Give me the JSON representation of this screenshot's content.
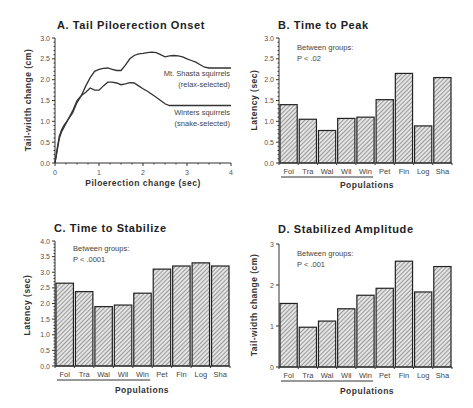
{
  "chart_data": [
    {
      "panel": "A",
      "type": "line",
      "title": "A.  Tail  Piloerection  Onset",
      "xlabel": "Piloerection  change  (sec)",
      "ylabel": "Tail-width  change  (cm)",
      "xlim": [
        0,
        4
      ],
      "ylim": [
        0,
        3.0
      ],
      "xticks": [
        "0",
        "1",
        "2",
        "3",
        "4"
      ],
      "yticks": [
        "0.0",
        "0.5",
        "1.0",
        "1.5",
        "2.0",
        "2.5",
        "3.0"
      ],
      "grid": false,
      "series": [
        {
          "name": "Mt. Shasta squirrels (relax-selected)",
          "label_lines": [
            "Mt. Shasta squirrels",
            "(relax-selected)"
          ],
          "x": [
            0,
            0.05,
            0.1,
            0.15,
            0.2,
            0.3,
            0.4,
            0.5,
            0.6,
            0.7,
            0.8,
            0.9,
            1.0,
            1.1,
            1.2,
            1.3,
            1.4,
            1.5,
            1.6,
            1.7,
            1.8,
            1.9,
            2.0,
            2.1,
            2.2,
            2.3,
            2.4,
            2.5,
            2.6,
            2.7,
            2.8,
            2.9,
            3.0,
            3.1,
            3.2,
            3.3,
            3.4,
            3.5,
            3.6,
            3.7,
            3.8,
            3.9,
            4.0
          ],
          "y": [
            0,
            0.3,
            0.6,
            0.75,
            0.85,
            1.05,
            1.2,
            1.45,
            1.62,
            1.85,
            2.05,
            2.2,
            2.25,
            2.27,
            2.28,
            2.25,
            2.22,
            2.22,
            2.35,
            2.5,
            2.58,
            2.62,
            2.63,
            2.65,
            2.66,
            2.65,
            2.6,
            2.55,
            2.57,
            2.58,
            2.57,
            2.55,
            2.5,
            2.46,
            2.42,
            2.36,
            2.3,
            2.28,
            2.28,
            2.28,
            2.28,
            2.28,
            2.28
          ]
        },
        {
          "name": "Winters squirrels (snake-selected)",
          "label_lines": [
            "Winters  squirrels",
            "(snake-selected)"
          ],
          "x": [
            0,
            0.05,
            0.1,
            0.15,
            0.2,
            0.3,
            0.4,
            0.5,
            0.6,
            0.7,
            0.8,
            0.9,
            1.0,
            1.1,
            1.2,
            1.3,
            1.4,
            1.5,
            1.6,
            1.7,
            1.8,
            1.9,
            2.0,
            2.1,
            2.2,
            2.3,
            2.4,
            2.5,
            2.6,
            2.7,
            2.8,
            2.9,
            3.0,
            3.2,
            3.4,
            3.6,
            3.8,
            4.0
          ],
          "y": [
            0,
            0.35,
            0.65,
            0.8,
            0.9,
            1.05,
            1.25,
            1.5,
            1.62,
            1.7,
            1.8,
            1.75,
            1.75,
            1.85,
            1.94,
            1.94,
            1.92,
            1.88,
            1.9,
            1.93,
            1.92,
            1.85,
            1.78,
            1.72,
            1.65,
            1.58,
            1.5,
            1.42,
            1.38,
            1.38,
            1.38,
            1.38,
            1.38,
            1.38,
            1.38,
            1.38,
            1.38,
            1.38
          ]
        }
      ]
    },
    {
      "panel": "B",
      "type": "bar",
      "title": "B.  Time  to  Peak",
      "xlabel": "Populations",
      "ylabel": "Latency  (sec)",
      "ylim": [
        0,
        3.0
      ],
      "yticks": [
        "0.0",
        "0.5",
        "1.0",
        "1.5",
        "2.0",
        "2.5",
        "3.0"
      ],
      "annotation": [
        "Between groups:",
        "P  <  .02"
      ],
      "categories": [
        "Fol",
        "Tra",
        "Wal",
        "Wil",
        "Win",
        "Pet",
        "Fin",
        "Log",
        "Sha"
      ],
      "values": [
        1.4,
        1.05,
        0.78,
        1.07,
        1.1,
        1.52,
        2.15,
        0.89,
        2.05
      ],
      "underlined_group": [
        "Fol",
        "Tra",
        "Wal",
        "Wil",
        "Win"
      ]
    },
    {
      "panel": "C",
      "type": "bar",
      "title": "C.  Time  to  Stabilize",
      "xlabel": "Populations",
      "ylabel": "Latency  (sec)",
      "ylim": [
        0,
        4.0
      ],
      "yticks": [
        "0.0",
        "0.5",
        "1.0",
        "1.5",
        "2.0",
        "2.5",
        "3.0",
        "3.5",
        "4.0"
      ],
      "annotation": [
        "Between groups:",
        "P  <  .0001"
      ],
      "categories": [
        "Fol",
        "Tra",
        "Wal",
        "Wil",
        "Win",
        "Pet",
        "Fin",
        "Log",
        "Sha"
      ],
      "values": [
        2.65,
        2.38,
        1.9,
        1.95,
        2.33,
        3.1,
        3.2,
        3.3,
        3.2
      ],
      "underlined_group": [
        "Fol",
        "Tra",
        "Wal",
        "Wil",
        "Win"
      ]
    },
    {
      "panel": "D",
      "type": "bar",
      "title": "D.  Stabilized  Amplitude",
      "xlabel": "Populations",
      "ylabel": "Tail-width  change  (cm)",
      "ylim": [
        0,
        3
      ],
      "yticks": [
        "0",
        "1",
        "2",
        "3"
      ],
      "annotation": [
        "Between groups:",
        "P  <  .001"
      ],
      "categories": [
        "Fol",
        "Tra",
        "Wal",
        "Wil",
        "Win",
        "Pet",
        "Fin",
        "Log",
        "Sha"
      ],
      "values": [
        1.55,
        0.97,
        1.12,
        1.42,
        1.75,
        1.92,
        2.58,
        1.83,
        2.45
      ],
      "underlined_group": [
        "Fol",
        "Tra",
        "Wal",
        "Wil",
        "Win"
      ]
    }
  ]
}
